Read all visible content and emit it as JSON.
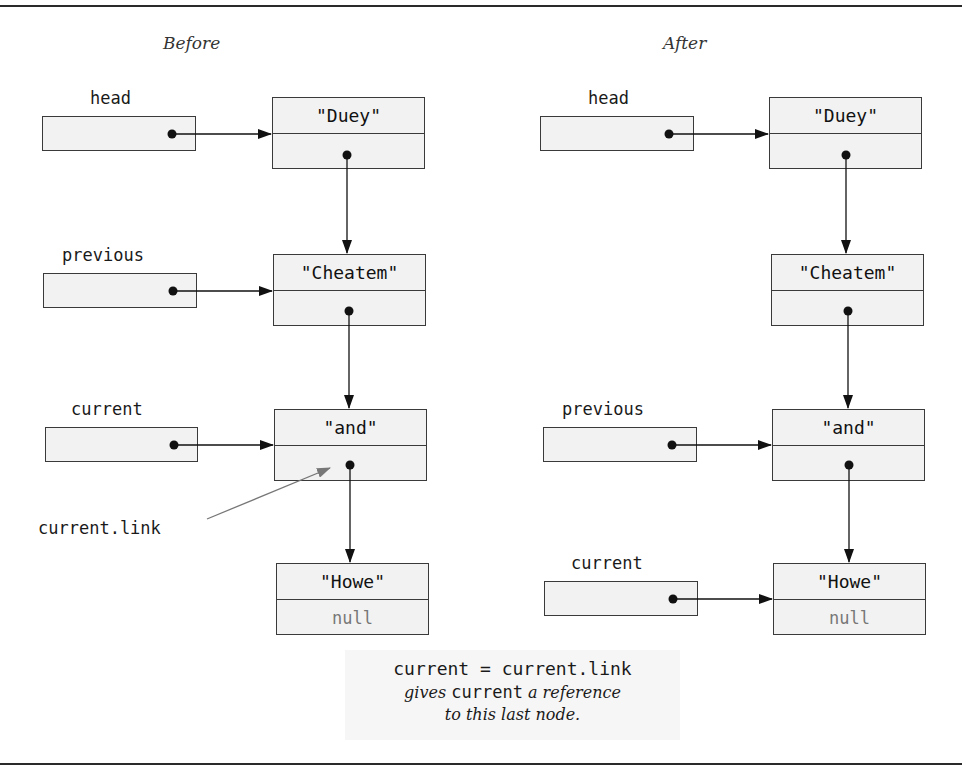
{
  "before": {
    "title": "Before",
    "variables": [
      {
        "name": "head",
        "points_to": "Duey"
      },
      {
        "name": "previous",
        "points_to": "Cheatem"
      },
      {
        "name": "current",
        "points_to": "and"
      }
    ],
    "nodes": [
      {
        "data": "\"Duey\"",
        "link": ""
      },
      {
        "data": "\"Cheatem\"",
        "link": ""
      },
      {
        "data": "\"and\"",
        "link": ""
      },
      {
        "data": "\"Howe\"",
        "link": "null"
      }
    ],
    "annotation": "current.link"
  },
  "after": {
    "title": "After",
    "variables": [
      {
        "name": "head",
        "points_to": "Duey"
      },
      {
        "name": "previous",
        "points_to": "and"
      },
      {
        "name": "current",
        "points_to": "Howe"
      }
    ],
    "nodes": [
      {
        "data": "\"Duey\"",
        "link": ""
      },
      {
        "data": "\"Cheatem\"",
        "link": ""
      },
      {
        "data": "\"and\"",
        "link": ""
      },
      {
        "data": "\"Howe\"",
        "link": "null"
      }
    ]
  },
  "caption": {
    "code": "current = current.link",
    "line1_pre": "gives ",
    "line1_code": "current",
    "line1_post": " a reference",
    "line2": "to this last node."
  },
  "colors": {
    "box_fill": "#f2f2f2",
    "stroke": "#3a3a3a",
    "annotation_arrow": "#777777"
  }
}
